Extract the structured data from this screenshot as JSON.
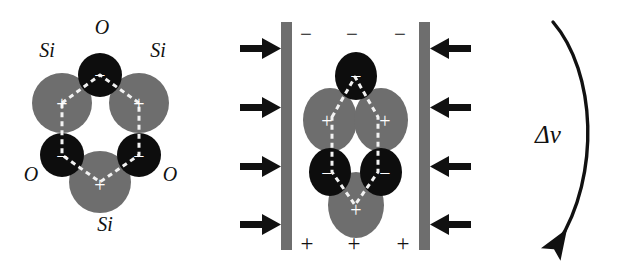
{
  "figure": {
    "background_color": "#ffffff",
    "si_color": "#6e6e6e",
    "o_color": "#0d0d0d",
    "plate_color": "#6e6e6e",
    "arrow_color": "#111111",
    "bond_color": "#f2f2f2",
    "sign_color": "#ffffff"
  },
  "panel_left": {
    "name": "relaxed-sio2-ring",
    "labels": {
      "si_top_left": "Si",
      "si_top_right": "Si",
      "si_bottom": "Si",
      "o_top": "O",
      "o_bottom_left": "O",
      "o_bottom_right": "O"
    },
    "charges": {
      "si_top_left": "+",
      "si_top_right": "+",
      "si_bottom": "+",
      "o_top": "−",
      "o_bottom_left": "−",
      "o_bottom_right": "−"
    },
    "atoms": [
      {
        "element": "Si",
        "role": "cation",
        "charge": "+",
        "label": "Si"
      },
      {
        "element": "Si",
        "role": "cation",
        "charge": "+",
        "label": "Si"
      },
      {
        "element": "Si",
        "role": "cation",
        "charge": "+",
        "label": "Si"
      },
      {
        "element": "O",
        "role": "anion",
        "charge": "−",
        "label": "O"
      },
      {
        "element": "O",
        "role": "anion",
        "charge": "−",
        "label": "O"
      },
      {
        "element": "O",
        "role": "anion",
        "charge": "−",
        "label": "O"
      }
    ]
  },
  "panel_middle": {
    "name": "compressed-sio2-ring-between-plates",
    "top_plate_charges": [
      "−",
      "−",
      "−"
    ],
    "bottom_plate_charges": [
      "+",
      "+",
      "+"
    ],
    "left_arrow_count": 4,
    "right_arrow_count": 4,
    "left_arrow_direction": "right",
    "right_arrow_direction": "left",
    "charges": {
      "si_top_left": "+",
      "si_top_right": "+",
      "si_bottom": "+",
      "o_top": "−",
      "o_bottom_left": "−",
      "o_bottom_right": "−"
    }
  },
  "panel_right": {
    "name": "volume-change-indicator",
    "label": "Δv",
    "arrow_direction": "downward-curved"
  }
}
